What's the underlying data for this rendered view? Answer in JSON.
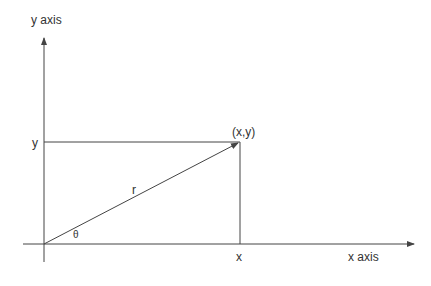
{
  "diagram": {
    "labels": {
      "y_axis": "y axis",
      "x_axis": "x axis",
      "y": "y",
      "x": "x",
      "point": "(x,y)",
      "r": "r",
      "theta": "θ"
    },
    "colors": {
      "line": "#444444",
      "text": "#333333"
    }
  }
}
